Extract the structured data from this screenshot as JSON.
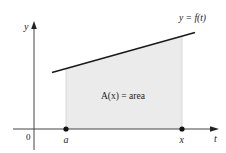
{
  "figure": {
    "axes": {
      "y_label": "y",
      "x_label": "t",
      "origin_label": "0"
    },
    "points": [
      {
        "label": "a"
      },
      {
        "label": "x"
      }
    ],
    "curve_label": "y = f(t)",
    "region_label": "A(x) = area",
    "colors": {
      "region_fill": "#ebebeb",
      "region_edge": "#d0d0d0",
      "curve": "#1a1a1a",
      "axis": "#444444",
      "point": "#111111"
    }
  }
}
